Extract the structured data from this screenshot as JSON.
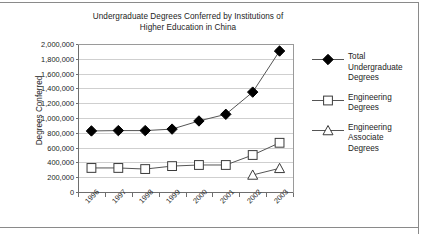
{
  "chart_data": {
    "type": "line",
    "title": "Undergraduate Degrees Conferred by Institutions of Higher Education in China",
    "title_line1": "Undergraduate Degrees Conferred by Institutions of",
    "title_line2": "Higher Education in China",
    "xlabel": "",
    "ylabel": "Degrees Conferred",
    "categories": [
      "1996",
      "1997",
      "1998",
      "1999",
      "2000",
      "2001",
      "2002",
      "2003"
    ],
    "ylim": [
      0,
      2000000
    ],
    "ytick_values": [
      0,
      200000,
      400000,
      600000,
      800000,
      1000000,
      1200000,
      1400000,
      1600000,
      1800000,
      2000000
    ],
    "ytick_labels": [
      "0",
      "200,000",
      "400,000",
      "600,000",
      "800,000",
      "1,000,000",
      "1,200,000",
      "1,400,000",
      "1,600,000",
      "1,800,000",
      "2,000,000"
    ],
    "grid": true,
    "legend_position": "right",
    "series": [
      {
        "name": "Total Undergraduate Degrees",
        "marker": "filled-diamond",
        "color": "#000000",
        "values": [
          825000,
          830000,
          830000,
          850000,
          960000,
          1050000,
          1350000,
          1905000
        ]
      },
      {
        "name": "Engineering Degrees",
        "marker": "open-square",
        "color": "#000000",
        "values": [
          325000,
          325000,
          310000,
          350000,
          365000,
          365000,
          500000,
          665000
        ]
      },
      {
        "name": "Engineering Associate Degrees",
        "marker": "open-triangle",
        "color": "#000000",
        "values": [
          null,
          null,
          null,
          null,
          null,
          null,
          230000,
          320000
        ]
      }
    ]
  },
  "legend": {
    "items": [
      {
        "label": "Total Undergraduate Degrees",
        "marker": "filled-diamond"
      },
      {
        "label": "Engineering Degrees",
        "marker": "open-square"
      },
      {
        "label": "Engineering Associate Degrees",
        "marker": "open-triangle"
      }
    ]
  }
}
